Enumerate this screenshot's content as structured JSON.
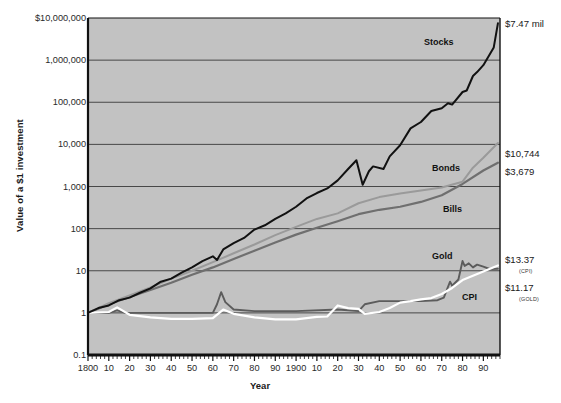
{
  "chart_data": {
    "type": "line",
    "title": "",
    "xlabel": "Year",
    "ylabel": "Value of a $1 investment",
    "log_y": true,
    "ylim": [
      0.1,
      10000000
    ],
    "xlim": [
      1800,
      1998
    ],
    "grid": "horizontal",
    "plot_bgcolor": "#c2c2c2",
    "ytick_labels": [
      "$10,000,000",
      "1,000,000",
      "100,000",
      "10,000",
      "1,000",
      "100",
      "10",
      "1",
      "0.1"
    ],
    "ytick_values": [
      10000000,
      1000000,
      100000,
      10000,
      1000,
      100,
      10,
      1,
      0.1
    ],
    "xtick_labels": [
      "1800",
      "10",
      "20",
      "30",
      "40",
      "50",
      "60",
      "70",
      "80",
      "90",
      "1900",
      "10",
      "20",
      "30",
      "40",
      "50",
      "60",
      "70",
      "80",
      "90"
    ],
    "xtick_values": [
      1800,
      1810,
      1820,
      1830,
      1840,
      1850,
      1860,
      1870,
      1880,
      1890,
      1900,
      1910,
      1920,
      1930,
      1940,
      1950,
      1960,
      1970,
      1980,
      1990
    ],
    "legend_position": "in-plot annotations",
    "series": [
      {
        "name": "Stocks",
        "color": "#111111",
        "label_x": 1938,
        "label_y": 2600000,
        "end_value": 7470000,
        "end_label": "$7.47 mil",
        "x": [
          1800,
          1805,
          1810,
          1815,
          1820,
          1825,
          1830,
          1835,
          1840,
          1845,
          1850,
          1855,
          1860,
          1862,
          1865,
          1870,
          1875,
          1880,
          1885,
          1890,
          1895,
          1900,
          1905,
          1910,
          1915,
          1920,
          1925,
          1929,
          1932,
          1935,
          1937,
          1942,
          1945,
          1950,
          1955,
          1960,
          1965,
          1970,
          1973,
          1975,
          1980,
          1982,
          1985,
          1987,
          1990,
          1995,
          1997
        ],
        "values": [
          1,
          1.3,
          1.5,
          2.0,
          2.3,
          3.0,
          3.8,
          5.5,
          6.5,
          9,
          12,
          17,
          22,
          18,
          32,
          45,
          60,
          95,
          120,
          170,
          230,
          330,
          520,
          700,
          900,
          1400,
          2600,
          4200,
          1100,
          2300,
          3000,
          2600,
          5200,
          9500,
          24000,
          34000,
          62000,
          72000,
          95000,
          88000,
          175000,
          190000,
          420000,
          520000,
          760000,
          2000000,
          7470000
        ]
      },
      {
        "name": "Bonds",
        "color": "#9a9a9a",
        "label_x": 1940,
        "label_y": 2600,
        "end_value": 10744,
        "end_label": "$10,744",
        "x": [
          1800,
          1810,
          1820,
          1830,
          1840,
          1850,
          1860,
          1870,
          1880,
          1890,
          1900,
          1910,
          1920,
          1930,
          1940,
          1950,
          1960,
          1970,
          1980,
          1985,
          1990,
          1997
        ],
        "values": [
          1,
          1.7,
          2.6,
          4,
          6.5,
          10,
          16,
          26,
          42,
          70,
          110,
          170,
          230,
          400,
          560,
          680,
          800,
          950,
          1300,
          2800,
          4800,
          10744
        ]
      },
      {
        "name": "Bills",
        "color": "#6f6f6f",
        "label_x": 1942,
        "label_y": 430,
        "end_value": 3679,
        "end_label": "$3,679",
        "x": [
          1800,
          1810,
          1820,
          1830,
          1840,
          1850,
          1860,
          1870,
          1880,
          1890,
          1900,
          1910,
          1920,
          1930,
          1940,
          1950,
          1960,
          1970,
          1980,
          1990,
          1997
        ],
        "values": [
          1,
          1.6,
          2.4,
          3.5,
          5.2,
          8,
          12,
          19,
          30,
          47,
          72,
          105,
          150,
          220,
          280,
          330,
          430,
          620,
          1150,
          2400,
          3679
        ]
      },
      {
        "name": "Gold",
        "color": "#5c5c5c",
        "label_x": 1963,
        "label_y": 33,
        "end_value": 11.17,
        "end_label": "$11.17",
        "end_sub": "(GOLD)",
        "x": [
          1800,
          1810,
          1814,
          1818,
          1830,
          1850,
          1860,
          1862,
          1864,
          1866,
          1870,
          1880,
          1900,
          1920,
          1930,
          1933,
          1940,
          1950,
          1960,
          1968,
          1971,
          1974,
          1975,
          1978,
          1980,
          1981,
          1983,
          1985,
          1987,
          1990,
          1993,
          1997
        ],
        "values": [
          1,
          1,
          1.15,
          1,
          1,
          1,
          1,
          1.6,
          3.1,
          1.8,
          1.2,
          1.1,
          1.1,
          1.2,
          1.1,
          1.6,
          1.9,
          1.9,
          1.9,
          2.0,
          2.3,
          5.5,
          4.4,
          6.2,
          17,
          13,
          15,
          12,
          14,
          12.5,
          11,
          11.17
        ]
      },
      {
        "name": "CPI",
        "color": "#ffffff",
        "label_x": 1968,
        "label_y": 3.6,
        "end_value": 13.37,
        "end_label": "$13.37",
        "end_sub": "(CPI)",
        "x": [
          1800,
          1810,
          1814,
          1820,
          1830,
          1840,
          1850,
          1860,
          1865,
          1870,
          1880,
          1890,
          1900,
          1910,
          1915,
          1920,
          1925,
          1930,
          1933,
          1940,
          1945,
          1950,
          1955,
          1960,
          1965,
          1970,
          1975,
          1980,
          1985,
          1990,
          1997
        ],
        "values": [
          1,
          1.05,
          1.35,
          0.9,
          0.78,
          0.72,
          0.72,
          0.75,
          1.2,
          0.95,
          0.78,
          0.7,
          0.7,
          0.8,
          0.82,
          1.5,
          1.3,
          1.25,
          0.95,
          1.05,
          1.3,
          1.75,
          1.9,
          2.1,
          2.25,
          2.8,
          3.9,
          6.0,
          7.6,
          9.6,
          13.37
        ]
      }
    ]
  },
  "annotations": {
    "stocks": "Stocks",
    "bonds": "Bonds",
    "bills": "Bills",
    "gold": "Gold",
    "cpi": "CPI"
  },
  "end_labels": {
    "stocks": "$7.47 mil",
    "bonds": "$10,744",
    "bills": "$3,679",
    "cpi": "$13.37",
    "cpi_sub": "(CPI)",
    "gold": "$11.17",
    "gold_sub": "(GOLD)"
  },
  "axis": {
    "ylabel": "Value of a $1 investment",
    "xlabel": "Year"
  }
}
